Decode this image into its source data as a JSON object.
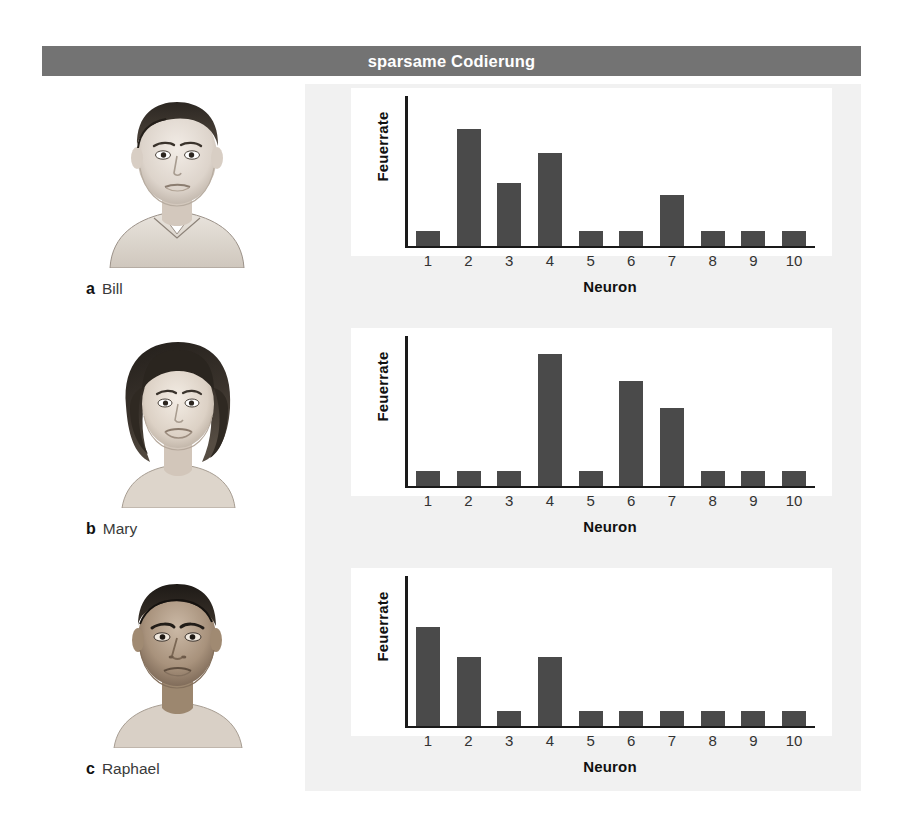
{
  "figure": {
    "title": "sparsame Codierung",
    "title_bar_color": "#737373",
    "panel_background": "#f1f1f1",
    "chart_background": "#ffffff",
    "bar_color": "#4a4a4a",
    "axis_color": "#1a1a1a"
  },
  "panels": [
    {
      "index_label": "a",
      "name": "Bill",
      "portrait": "portrait-bill-sketch",
      "portrait_description": "pencil sketch of young man with short dark hair and collared shirt"
    },
    {
      "index_label": "b",
      "name": "Mary",
      "portrait": "portrait-mary-sketch",
      "portrait_description": "pencil sketch of woman with dark bob haircut"
    },
    {
      "index_label": "c",
      "name": "Raphael",
      "portrait": "portrait-raphael-sketch",
      "portrait_description": "pencil sketch of man with very short hair and darker skin"
    }
  ],
  "chart_data": [
    {
      "type": "bar",
      "title": "Bill",
      "panel": "a",
      "xlabel": "Neuron",
      "ylabel": "Feuerrate",
      "categories": [
        "1",
        "2",
        "3",
        "4",
        "5",
        "6",
        "7",
        "8",
        "9",
        "10"
      ],
      "values": [
        10,
        78,
        42,
        62,
        10,
        10,
        34,
        10,
        10,
        10
      ],
      "ylim": [
        0,
        100
      ],
      "grid": false,
      "legend": "none"
    },
    {
      "type": "bar",
      "title": "Mary",
      "panel": "b",
      "xlabel": "Neuron",
      "ylabel": "Feuerrate",
      "categories": [
        "1",
        "2",
        "3",
        "4",
        "5",
        "6",
        "7",
        "8",
        "9",
        "10"
      ],
      "values": [
        10,
        10,
        10,
        88,
        10,
        70,
        52,
        10,
        10,
        10
      ],
      "ylim": [
        0,
        100
      ],
      "grid": false,
      "legend": "none"
    },
    {
      "type": "bar",
      "title": "Raphael",
      "panel": "c",
      "xlabel": "Neuron",
      "ylabel": "Feuerrate",
      "categories": [
        "1",
        "2",
        "3",
        "4",
        "5",
        "6",
        "7",
        "8",
        "9",
        "10"
      ],
      "values": [
        66,
        46,
        10,
        46,
        10,
        10,
        10,
        10,
        10,
        10
      ],
      "ylim": [
        0,
        100
      ],
      "grid": false,
      "legend": "none"
    }
  ]
}
